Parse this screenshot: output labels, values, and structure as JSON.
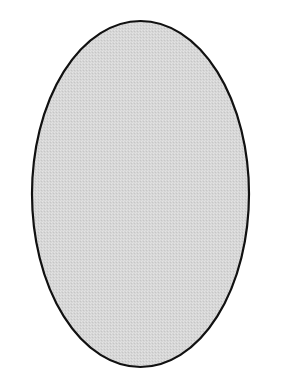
{
  "figure": {
    "shape": "ellipse",
    "description": "Vertical ellipse with black outline and light gray stippled fill",
    "center": {
      "x": 140.5,
      "y": 194
    },
    "radius": {
      "x": 108.5,
      "y": 173
    },
    "stroke_width": 2.2,
    "colors": {
      "background": "#ffffff",
      "fill": "#d6d6d6",
      "fill_dot_light": "#e4e4e4",
      "fill_dot_dark": "#c6c6c6",
      "stroke": "#111111"
    }
  }
}
